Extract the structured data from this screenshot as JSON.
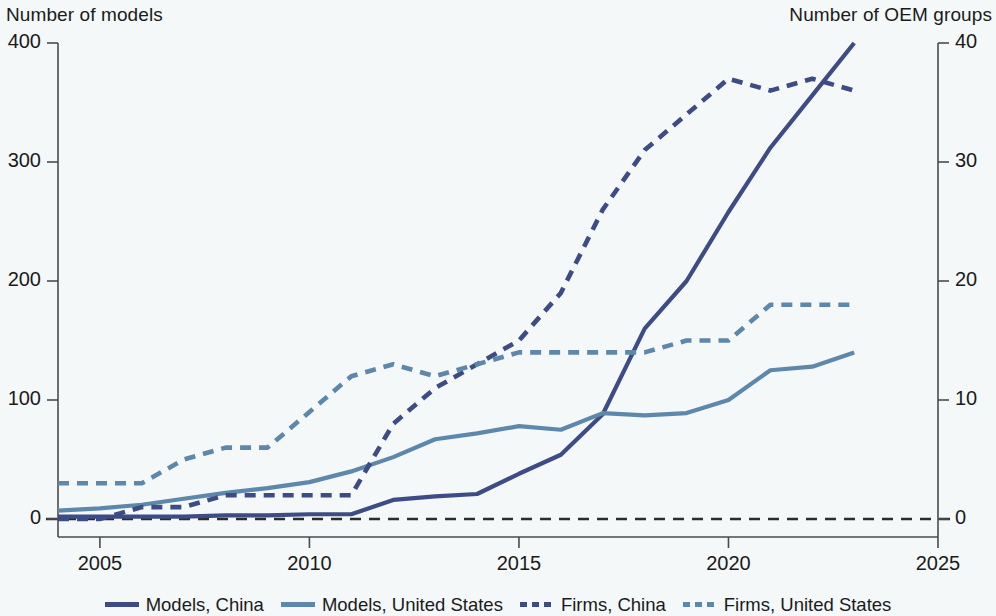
{
  "chart_data": {
    "type": "line",
    "title": "",
    "subtitle": "",
    "left_axis_label": "Number of models",
    "right_axis_label": "Number of OEM groups",
    "xlabel": "",
    "xlim": [
      2004,
      2025
    ],
    "x_ticks": [
      "2005",
      "2010",
      "2015",
      "2020",
      "2025"
    ],
    "x_tick_values": [
      2005,
      2010,
      2015,
      2020,
      2025
    ],
    "left_ylim": [
      0,
      400
    ],
    "left_y_ticks": [
      "0",
      "100",
      "200",
      "300",
      "400"
    ],
    "left_y_tick_values": [
      0,
      100,
      200,
      300,
      400
    ],
    "right_ylim": [
      0,
      40
    ],
    "right_y_ticks": [
      "0",
      "10",
      "20",
      "30",
      "40"
    ],
    "right_y_tick_values": [
      0,
      10,
      20,
      30,
      40
    ],
    "grid": false,
    "legend_position": "bottom",
    "x": [
      2004,
      2005,
      2006,
      2007,
      2008,
      2009,
      2010,
      2011,
      2012,
      2013,
      2014,
      2015,
      2016,
      2017,
      2018,
      2019,
      2020,
      2021,
      2022,
      2023
    ],
    "series": [
      {
        "name": "Models, China",
        "axis": "left",
        "style": "solid",
        "color": "#3d4c84",
        "values": [
          2,
          2,
          2,
          2,
          3,
          3,
          4,
          4,
          16,
          19,
          21,
          38,
          54,
          88,
          160,
          200,
          258,
          312,
          356,
          400
        ]
      },
      {
        "name": "Models, United States",
        "axis": "left",
        "style": "solid",
        "color": "#5d88ab",
        "values": [
          7,
          9,
          12,
          17,
          22,
          26,
          31,
          40,
          52,
          67,
          72,
          78,
          75,
          89,
          87,
          89,
          100,
          125,
          128,
          140
        ]
      },
      {
        "name": "Firms, China",
        "axis": "right",
        "style": "dashed",
        "color": "#3d4c84",
        "values": [
          0,
          0,
          1,
          1,
          2,
          2,
          2,
          2,
          8,
          11,
          13,
          15,
          19,
          26,
          31,
          34,
          37,
          36,
          37,
          36
        ]
      },
      {
        "name": "Firms, United States",
        "axis": "right",
        "style": "dashed",
        "color": "#5d88ab",
        "values": [
          3,
          3,
          3,
          5,
          6,
          6,
          9,
          12,
          13,
          12,
          13,
          14,
          14,
          14,
          14,
          15,
          15,
          18,
          18,
          18
        ]
      }
    ]
  },
  "legend": {
    "items": [
      {
        "label": "Models, China",
        "color": "#3d4c84",
        "style": "solid"
      },
      {
        "label": "Models, United States",
        "color": "#5d88ab",
        "style": "solid"
      },
      {
        "label": "Firms, China",
        "color": "#3d4c84",
        "style": "dashed"
      },
      {
        "label": "Firms, United States",
        "color": "#5d88ab",
        "style": "dashed"
      }
    ]
  }
}
